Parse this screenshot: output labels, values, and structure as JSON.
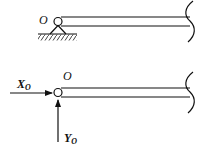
{
  "top_diagram": {
    "pin_label": "O",
    "support": "pin-support-with-ground-hatching"
  },
  "bottom_diagram": {
    "pin_label": "O",
    "force_x": {
      "label": "X",
      "subscript": "O"
    },
    "force_y": {
      "label": "Y",
      "subscript": "O"
    }
  },
  "colors": {
    "line": "#111111",
    "background": "#ffffff"
  }
}
